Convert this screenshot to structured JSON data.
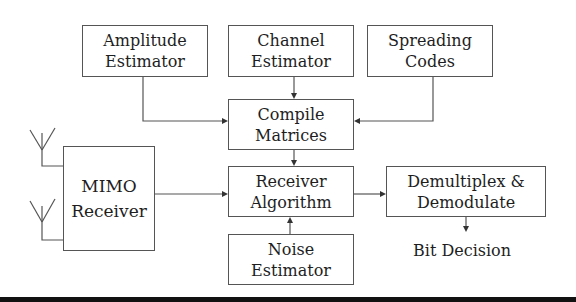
{
  "diagram": {
    "type": "block-diagram",
    "blocks": {
      "amplitude_estimator": {
        "line1": "Amplitude",
        "line2": "Estimator"
      },
      "channel_estimator": {
        "line1": "Channel",
        "line2": "Estimator"
      },
      "spreading_codes": {
        "line1": "Spreading",
        "line2": "Codes"
      },
      "compile_matrices": {
        "line1": "Compile",
        "line2": "Matrices"
      },
      "mimo_receiver": {
        "line1": "MIMO",
        "line2": "Receiver"
      },
      "receiver_algorithm": {
        "line1": "Receiver",
        "line2": "Algorithm"
      },
      "noise_estimator": {
        "line1": "Noise",
        "line2": "Estimator"
      },
      "demultiplex_demodulate": {
        "line1": "Demultiplex &",
        "line2": "Demodulate"
      }
    },
    "outputs": {
      "bit_decision": "Bit Decision"
    },
    "connections": [
      {
        "from": "Amplitude Estimator",
        "to": "Compile Matrices"
      },
      {
        "from": "Channel Estimator",
        "to": "Compile Matrices"
      },
      {
        "from": "Spreading Codes",
        "to": "Compile Matrices"
      },
      {
        "from": "Compile Matrices",
        "to": "Receiver Algorithm"
      },
      {
        "from": "MIMO Receiver",
        "to": "Receiver Algorithm"
      },
      {
        "from": "Noise Estimator",
        "to": "Receiver Algorithm"
      },
      {
        "from": "Receiver Algorithm",
        "to": "Demultiplex & Demodulate"
      },
      {
        "from": "Demultiplex & Demodulate",
        "to": "Bit Decision"
      },
      {
        "from": "Antenna 1",
        "to": "MIMO Receiver"
      },
      {
        "from": "Antenna 2",
        "to": "MIMO Receiver"
      }
    ],
    "colors": {
      "line": "#555555",
      "text": "#1e1e1e",
      "background": "#ffffff",
      "bottom_bar": "#111111"
    }
  }
}
